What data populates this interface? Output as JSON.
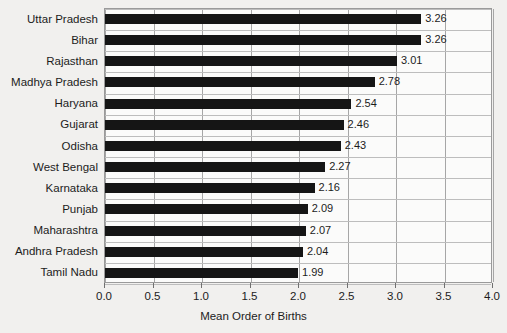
{
  "chart_data": {
    "type": "bar",
    "orientation": "horizontal",
    "title": "",
    "subtitle": "",
    "xlabel": "Mean Order of Births",
    "ylabel": "",
    "xlim": [
      0.0,
      4.0
    ],
    "xticks": [
      "0.0",
      "0.5",
      "1.0",
      "1.5",
      "2.0",
      "2.5",
      "3.0",
      "3.5",
      "4.0"
    ],
    "xtick_values": [
      0.0,
      0.5,
      1.0,
      1.5,
      2.0,
      2.5,
      3.0,
      3.5,
      4.0
    ],
    "grid": "both",
    "legend": "none",
    "bar_color": "#151515",
    "categories": [
      "Uttar Pradesh",
      "Bihar",
      "Rajasthan",
      "Madhya Pradesh",
      "Haryana",
      "Gujarat",
      "Odisha",
      "West Bengal",
      "Karnataka",
      "Punjab",
      "Maharashtra",
      "Andhra Pradesh",
      "Tamil Nadu"
    ],
    "values": [
      3.26,
      3.26,
      3.01,
      2.78,
      2.54,
      2.46,
      2.43,
      2.27,
      2.16,
      2.09,
      2.07,
      2.04,
      1.99
    ],
    "value_labels": [
      "3.26",
      "3.26",
      "3.01",
      "2.78",
      "2.54",
      "2.46",
      "2.43",
      "2.27",
      "2.16",
      "2.09",
      "2.07",
      "2.04",
      "1.99"
    ]
  }
}
